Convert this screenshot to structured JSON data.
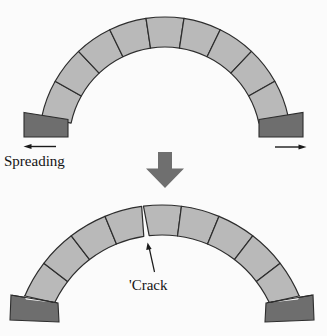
{
  "canvas": {
    "width": 327,
    "height": 336
  },
  "colors": {
    "background": "#fbfbfb",
    "voussoir": "#b9b9b9",
    "abutment": "#6e6e6e",
    "outline": "#2d2d2d",
    "arrow": "#6f6f6f",
    "line": "#1a1a1a",
    "text": "#141414"
  },
  "labels": {
    "spreading": "Spreading",
    "crack": "'Crack"
  },
  "figures": {
    "top_arch": {
      "cx": 165,
      "cy": 143,
      "outer_r": 126,
      "inner_r": 96,
      "half_span_deg": 78,
      "voussoirs": 9
    },
    "bottom_arch": {
      "cx": 162,
      "cy": 354,
      "outer_r": 149,
      "inner_r": 119,
      "half_span_deg": 67.5,
      "voussoirs": 9,
      "crack": {
        "joint": 4,
        "outer_gap_deg": 0.35,
        "inner_gap_deg": 1.3
      }
    }
  }
}
